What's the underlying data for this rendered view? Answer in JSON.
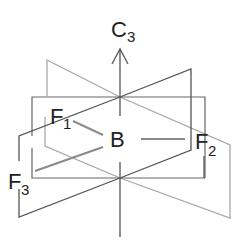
{
  "diagram": {
    "axis_label": "C",
    "axis_subscript": "3",
    "central_atom": "B",
    "ligands": [
      {
        "label": "F",
        "subscript": "1"
      },
      {
        "label": "F",
        "subscript": "2"
      },
      {
        "label": "F",
        "subscript": "3"
      }
    ],
    "colors": {
      "dark_line": "#555555",
      "light_line": "#a8a8a8",
      "bond": "#8a8a8a",
      "text": "#222222"
    }
  }
}
